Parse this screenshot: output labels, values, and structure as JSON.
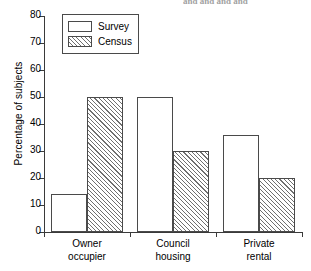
{
  "top_fragment": "and and and and",
  "chart_data": {
    "type": "bar",
    "title": "",
    "xlabel": "",
    "ylabel": "Percentage of subjects",
    "categories": [
      "Owner occupier",
      "Council housing",
      "Private rental"
    ],
    "category_lines": [
      [
        "Owner",
        "occupier"
      ],
      [
        "Council",
        "housing"
      ],
      [
        "Private",
        "rental"
      ]
    ],
    "series": [
      {
        "name": "Survey",
        "values": [
          14,
          50,
          36
        ],
        "fill": "solid-white"
      },
      {
        "name": "Census",
        "values": [
          50,
          30,
          20
        ],
        "fill": "hatched"
      }
    ],
    "ylim": [
      0,
      80
    ],
    "yticks": [
      0,
      10,
      20,
      30,
      40,
      50,
      60,
      70,
      80
    ],
    "ytick_labels": [
      "0",
      "10",
      "20",
      "30",
      "40",
      "50",
      "60",
      "70",
      "80"
    ],
    "grid": false,
    "legend_position": "upper-left"
  },
  "legend": {
    "items": [
      {
        "label": "Survey"
      },
      {
        "label": "Census"
      }
    ]
  },
  "colors": {
    "axis": "#3a3a3a",
    "bar_outline": "#4a4a4a",
    "bar_fill": "#ffffff",
    "hatch": "#6f6f6f",
    "text": "#000000"
  }
}
